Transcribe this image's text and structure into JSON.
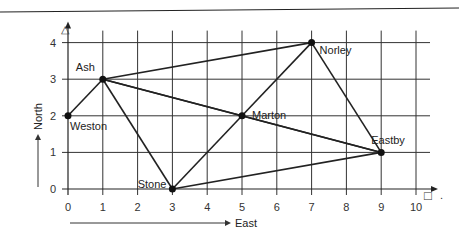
{
  "diagram": {
    "type": "coordinate-grid-network",
    "x_axis": {
      "label": "East",
      "ticks": [
        0,
        1,
        2,
        3,
        4,
        5,
        6,
        7,
        8,
        9,
        10
      ],
      "range": [
        0,
        10
      ]
    },
    "y_axis": {
      "label": "North",
      "ticks": [
        0,
        1,
        2,
        3,
        4
      ],
      "range": [
        0,
        4
      ]
    },
    "corner_symbols": {
      "top_left": "△",
      "bottom_right": "□"
    },
    "towns": [
      {
        "name": "Weston",
        "x": 0,
        "y": 2
      },
      {
        "name": "Ash",
        "x": 1,
        "y": 3
      },
      {
        "name": "Stone",
        "x": 3,
        "y": 0
      },
      {
        "name": "Marton",
        "x": 5,
        "y": 2
      },
      {
        "name": "Norley",
        "x": 7,
        "y": 4
      },
      {
        "name": "Eastby",
        "x": 9,
        "y": 1
      }
    ],
    "routes": [
      [
        "Weston",
        "Ash"
      ],
      [
        "Ash",
        "Norley"
      ],
      [
        "Ash",
        "Stone"
      ],
      [
        "Ash",
        "Marton"
      ],
      [
        "Ash",
        "Eastby"
      ],
      [
        "Stone",
        "Marton"
      ],
      [
        "Stone",
        "Eastby"
      ],
      [
        "Marton",
        "Norley"
      ],
      [
        "Norley",
        "Eastby"
      ],
      [
        "Marton",
        "Eastby"
      ]
    ]
  }
}
